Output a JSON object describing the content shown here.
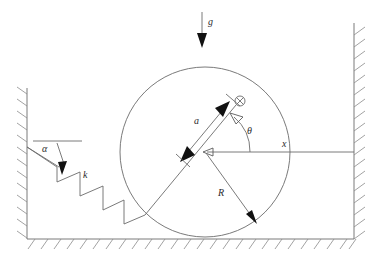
{
  "figure": {
    "type": "mechanics-schematic",
    "width": 382,
    "height": 262,
    "background_color": "#ffffff",
    "line_color": "#6b6b6b",
    "label_color": "#2b2b2b",
    "arrow_fill": "#111111"
  },
  "labels": {
    "gravity": "g",
    "spring_constant": "k",
    "incline_angle": "α",
    "rotation_angle": "θ",
    "offset_distance": "a",
    "radius": "R",
    "horizontal_axis": "x"
  },
  "elements": {
    "gravity_arrow": {
      "label": "g",
      "direction": "down",
      "x": 202,
      "y_start": 12,
      "y_end": 46,
      "label_x": 209,
      "label_y": 24
    },
    "circle": {
      "center_x": 205,
      "center_y": 152,
      "radius": 85,
      "label": "R"
    },
    "center_of_mass_marker": {
      "icon": "circle-times-icon",
      "meaning": "into-page vector / mass center marker",
      "x": 240,
      "y": 101,
      "radius": 5
    },
    "offset_segment": {
      "label": "a",
      "label_x": 197,
      "label_y": 122,
      "from_x": 237,
      "from_y": 104,
      "to_x": 145,
      "to_y": 215
    },
    "radius_arrow": {
      "label": "R",
      "label_x": 221,
      "label_y": 193,
      "from_x": 205,
      "from_y": 152,
      "to_x": 256,
      "to_y": 222
    },
    "x_axis": {
      "label": "x",
      "label_x": 285,
      "label_y": 147,
      "from_x": 354,
      "from_y": 152,
      "to_x": 205,
      "to_y": 152
    },
    "theta_arc": {
      "label": "θ",
      "label_x": 251,
      "label_y": 131,
      "radius": 45,
      "start_deg": 0,
      "end_deg": 50
    },
    "alpha_angle": {
      "label": "α",
      "label_x": 46,
      "label_y": 150,
      "reference_line_x1": 33,
      "reference_line_x2": 80,
      "reference_line_y": 141
    },
    "spring": {
      "label": "k",
      "label_x": 86,
      "label_y": 175,
      "anchor_wall_x": 27,
      "anchor_wall_y": 147,
      "attach_circle_x": 145,
      "attach_circle_y": 215
    },
    "left_wall": {
      "x": 27,
      "y_top": 88,
      "y_bottom": 239,
      "hatch_side": "left"
    },
    "right_wall": {
      "x": 354,
      "y_top": 23,
      "y_bottom": 239,
      "hatch_side": "right"
    },
    "ground": {
      "y": 239,
      "x_start": 27,
      "x_end": 354,
      "hatch_side": "below"
    }
  }
}
